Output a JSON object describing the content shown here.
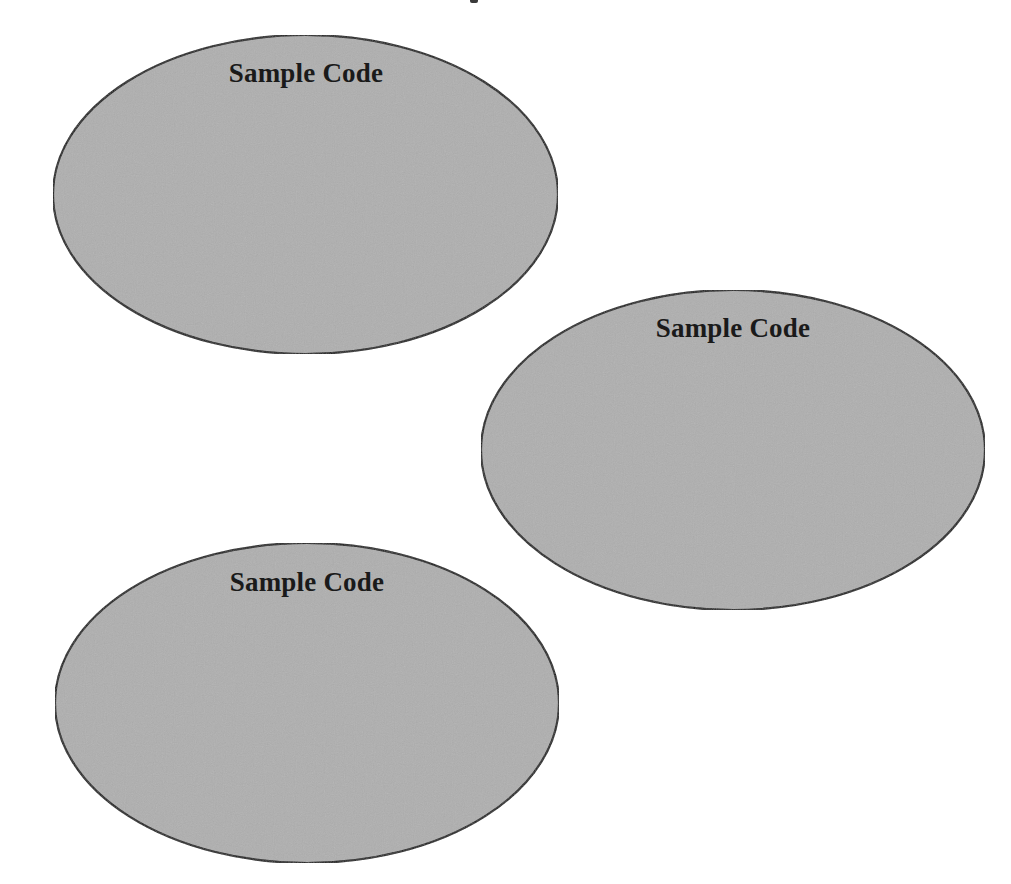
{
  "diagram": {
    "background": "#ffffff",
    "style": {
      "fill": "#afafaf",
      "stroke": "#1a1a1a",
      "stroke_width": 2.2,
      "text_color": "#1a1a1a"
    },
    "nodes": [
      {
        "id": "node-1",
        "shape": "ellipse",
        "label": "Sample Code",
        "cx": 305.5,
        "cy": 194.5,
        "rx": 252.5,
        "ry": 159.5,
        "label_x": 306,
        "label_top": 60
      },
      {
        "id": "node-2",
        "shape": "ellipse",
        "label": "Sample Code",
        "cx": 733,
        "cy": 450,
        "rx": 252,
        "ry": 160,
        "label_x": 733,
        "label_top": 315
      },
      {
        "id": "node-3",
        "shape": "ellipse",
        "label": "Sample Code",
        "cx": 307,
        "cy": 703,
        "rx": 252,
        "ry": 160,
        "label_x": 307,
        "label_top": 569
      }
    ]
  }
}
